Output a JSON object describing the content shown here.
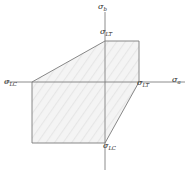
{
  "figure": {
    "axes": {
      "x_label": "σ",
      "x_subscript": "a",
      "y_label": "σ",
      "y_subscript": "b",
      "origin_px": [
        105,
        82
      ],
      "x_axis_extent_px": [
        5,
        185
      ],
      "y_axis_extent_px": [
        12,
        170
      ],
      "axis_color": "#808080"
    },
    "labels": [
      {
        "name": "sigma-b-axis-label",
        "symbol": "σ",
        "subscript": "b",
        "x": 98,
        "y": 3
      },
      {
        "name": "sigma-a-axis-label",
        "symbol": "σ",
        "subscript": "a",
        "x": 172,
        "y": 76
      },
      {
        "name": "sigma-lt-top-label",
        "symbol": "σ",
        "subscript": "LT",
        "x": 100,
        "y": 28
      },
      {
        "name": "sigma-lc-left-label",
        "symbol": "σ",
        "subscript": "LC",
        "x": 4,
        "y": 78
      },
      {
        "name": "sigma-lt-right-label",
        "symbol": "σ",
        "subscript": "LT",
        "x": 137,
        "y": 79
      },
      {
        "name": "sigma-lc-bottom-label",
        "symbol": "σ",
        "subscript": "LC",
        "x": 103,
        "y": 142
      }
    ],
    "envelope": {
      "description": "Maximum-stress / Tsai-Hill style biaxial failure envelope polygon",
      "points_px": "32,82 32,143 105,143 139,82 139,41 105,41",
      "fill_color": "#f2f2f2",
      "stroke_color": "#7a7a7a",
      "stroke_width": 0.9,
      "hatch_color": "#e2e2e2"
    }
  },
  "chart_data": {
    "type": "line",
    "xlabel": "σa",
    "ylabel": "σb",
    "annotations": [
      "σLT",
      "σLC",
      "σLT",
      "σLC"
    ],
    "vertices": [
      {
        "label": "σLC",
        "x": -1.0,
        "y": 0.0
      },
      {
        "label": "",
        "x": -1.0,
        "y": -1.0
      },
      {
        "label": "σLC",
        "x": 0.0,
        "y": -1.0
      },
      {
        "label": "σLT",
        "x": 0.47,
        "y": 0.0
      },
      {
        "label": "",
        "x": 0.47,
        "y": 0.57
      },
      {
        "label": "σLT",
        "x": 0.0,
        "y": 0.57
      }
    ],
    "xlim": [
      -1.4,
      1.1
    ],
    "ylim": [
      -1.2,
      1.15
    ],
    "grid": false,
    "legend": "none"
  }
}
